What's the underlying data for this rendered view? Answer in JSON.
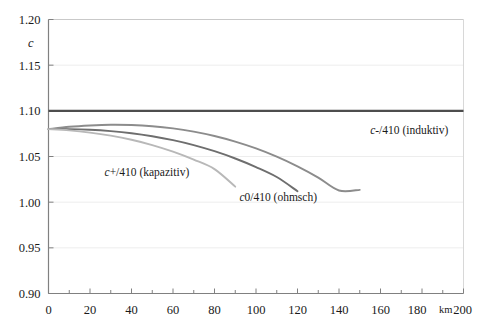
{
  "chart_data": {
    "type": "line",
    "title": "",
    "xlabel": "km",
    "ylabel": "c",
    "xlim": [
      0,
      200
    ],
    "ylim": [
      0.9,
      1.2
    ],
    "grid": true,
    "legend_position": "inline-annotations",
    "x_ticks": [
      0,
      20,
      40,
      60,
      80,
      100,
      120,
      140,
      160,
      180,
      200
    ],
    "x_tick_labels": [
      "0",
      "20",
      "40",
      "60",
      "80",
      "100",
      "120",
      "140",
      "160",
      "180",
      "200"
    ],
    "x_minor_tick_step": 10,
    "y_ticks": [
      0.9,
      0.95,
      1.0,
      1.05,
      1.1,
      1.15,
      1.2
    ],
    "y_tick_labels": [
      "0.90",
      "0.95",
      "1.00",
      "1.05",
      "1.10",
      "1.15",
      "1.20"
    ],
    "reference_line": {
      "name": "limit-1.10",
      "value": 1.1,
      "color": "#4d4d4d",
      "width": 2.2,
      "x_from": 0,
      "x_to": 200
    },
    "series": [
      {
        "name": "c-/410 (induktiv)",
        "label_plain": "c-/410 (induktiv)",
        "label_italic_prefix": "c",
        "label_rest": "-/410 (induktiv)",
        "color": "#8c8c8c",
        "width": 1.9,
        "x": [
          0,
          10,
          20,
          30,
          40,
          50,
          60,
          70,
          80,
          90,
          100,
          110,
          120,
          130,
          140,
          150
        ],
        "y": [
          1.08,
          1.0825,
          1.084,
          1.0848,
          1.0845,
          1.0832,
          1.0808,
          1.0772,
          1.0724,
          1.0663,
          1.0588,
          1.0498,
          1.0392,
          1.0269,
          1.0128,
          1.0135
        ]
      },
      {
        "name": "c0/410 (ohmsch)",
        "label_plain": "c0/410 (ohmsch)",
        "label_italic_prefix": "c",
        "label_rest": "0/410 (ohmsch)",
        "color": "#6e6e6e",
        "width": 1.9,
        "x": [
          0,
          10,
          20,
          30,
          40,
          50,
          60,
          70,
          80,
          90,
          100,
          110,
          120
        ],
        "y": [
          1.08,
          1.08,
          1.0793,
          1.0778,
          1.0755,
          1.0722,
          1.0679,
          1.0625,
          1.0558,
          1.0478,
          1.0384,
          1.0275,
          1.012
        ]
      },
      {
        "name": "c+/410 (kapazitiv)",
        "label_plain": "c+/410 (kapazitiv)",
        "label_italic_prefix": "c",
        "label_rest": "+/410 (kapazitiv)",
        "color": "#b8b8b8",
        "width": 1.9,
        "x": [
          0,
          10,
          20,
          30,
          40,
          50,
          60,
          70,
          80,
          90
        ],
        "y": [
          1.08,
          1.0786,
          1.0762,
          1.0728,
          1.0683,
          1.0625,
          1.0553,
          1.0466,
          1.0362,
          1.017
        ]
      }
    ],
    "annotations": [
      {
        "name": "label-induktiv",
        "text": "c-/410 (induktiv)",
        "x": 155,
        "y": 1.0745
      },
      {
        "name": "label-ohmsch",
        "text": "c0/410 (ohmsch)",
        "x": 92,
        "y": 1.0015
      },
      {
        "name": "label-kapazitiv",
        "text": "c+/410 (kapazitiv)",
        "x": 27,
        "y": 1.0287
      }
    ],
    "colors": {
      "axis": "#808080",
      "grid": "#ededed",
      "text": "#1a1a1a",
      "background": "#ffffff"
    }
  }
}
